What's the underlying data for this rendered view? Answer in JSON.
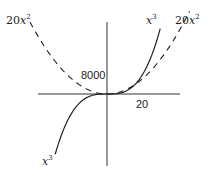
{
  "chart_data": {
    "type": "line",
    "title": "",
    "xlabel": "",
    "ylabel": "",
    "x_range": [
      -55,
      60
    ],
    "y_range": [
      -60000,
      62000
    ],
    "grid": false,
    "legend": "inline labels",
    "series": [
      {
        "name": "x^3",
        "style": "solid",
        "formula": "y = x^3",
        "x_from": -37,
        "x_to": 38
      },
      {
        "name": "20x^2",
        "style": "dashed",
        "formula": "y = 20x^2",
        "x_from": -55,
        "x_to": 59
      }
    ],
    "annotations": [
      {
        "text": "8000",
        "kind": "y-tick",
        "value": 8000
      },
      {
        "text": "20",
        "kind": "x-tick",
        "value": 20
      }
    ],
    "intersection": {
      "x": 20,
      "y": 8000
    }
  },
  "labels": {
    "left_dashed": {
      "coef": "20",
      "var": "x",
      "exp": "2"
    },
    "right_dashed": {
      "coef": "20",
      "var": "x",
      "exp": "2"
    },
    "right_solid": {
      "var": "x",
      "exp": "3"
    },
    "left_solid": {
      "var": "x",
      "exp": "3"
    },
    "y_tick": "8000",
    "x_tick": "20"
  }
}
